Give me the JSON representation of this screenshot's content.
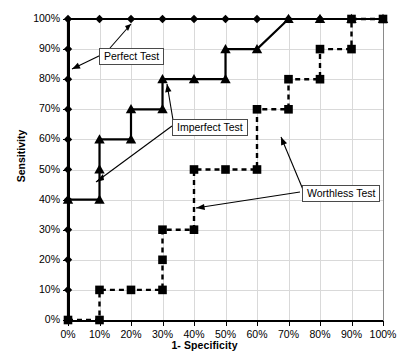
{
  "chart_data": {
    "type": "line",
    "title": "",
    "xlabel": "1- Specificity",
    "ylabel": "Sensitivity",
    "xlim": [
      0,
      100
    ],
    "ylim": [
      0,
      100
    ],
    "grid": true,
    "legend_position": "none",
    "xticks": [
      "0%",
      "10%",
      "20%",
      "30%",
      "40%",
      "50%",
      "60%",
      "70%",
      "80%",
      "90%",
      "100%"
    ],
    "yticks": [
      "0%",
      "10%",
      "20%",
      "30%",
      "40%",
      "50%",
      "60%",
      "70%",
      "80%",
      "90%",
      "100%"
    ],
    "xtickvals": [
      0,
      10,
      20,
      30,
      40,
      50,
      60,
      70,
      80,
      90,
      100
    ],
    "ytickvals": [
      0,
      10,
      20,
      30,
      40,
      50,
      60,
      70,
      80,
      90,
      100
    ],
    "series": [
      {
        "name": "Perfect Test",
        "marker": "diamond",
        "line": "solid",
        "x": [
          0,
          0,
          0,
          0,
          0,
          0,
          0,
          0,
          0,
          0,
          0,
          10,
          20,
          30,
          40,
          50,
          60,
          70,
          80,
          90,
          100
        ],
        "y": [
          0,
          10,
          20,
          30,
          40,
          50,
          60,
          70,
          80,
          90,
          100,
          100,
          100,
          100,
          100,
          100,
          100,
          100,
          100,
          100,
          100
        ]
      },
      {
        "name": "Imperfect Test",
        "marker": "triangle",
        "line": "solid",
        "x": [
          0,
          10,
          10,
          10,
          20,
          20,
          30,
          30,
          40,
          50,
          50,
          60,
          70,
          80,
          90,
          100
        ],
        "y": [
          40,
          40,
          50,
          60,
          60,
          70,
          70,
          80,
          80,
          80,
          90,
          90,
          100,
          100,
          100,
          100
        ]
      },
      {
        "name": "Worthless Test",
        "marker": "square",
        "line": "dashed",
        "x": [
          0,
          10,
          10,
          20,
          30,
          30,
          30,
          40,
          40,
          50,
          60,
          60,
          70,
          70,
          80,
          80,
          90,
          90,
          100
        ],
        "y": [
          0,
          0,
          10,
          10,
          10,
          20,
          30,
          30,
          50,
          50,
          50,
          70,
          70,
          80,
          80,
          90,
          90,
          100,
          100
        ]
      }
    ],
    "annotations": [
      {
        "text": "Perfect Test",
        "label_x": 99,
        "label_y": 48,
        "point_x": 72,
        "point_y": 69
      },
      {
        "text": "Imperfect Test",
        "label_x": 172,
        "label_y": 119,
        "point_x": 167,
        "point_y": 84
      },
      {
        "text": "Worthless Test",
        "label_x": 302,
        "label_y": 185,
        "point_x": 281,
        "point_y": 137
      }
    ]
  },
  "axes": {
    "xtitle": "1- Specificity",
    "ytitle": "Sensitivity"
  },
  "labels": {
    "perfect": "Perfect Test",
    "imperfect": "Imperfect Test",
    "worthless": "Worthless Test"
  },
  "colors": {
    "series": "#000000",
    "grid": "#d9d9d9",
    "axis": "#000000",
    "callout_border": "#4a4a4a",
    "background": "#ffffff"
  }
}
